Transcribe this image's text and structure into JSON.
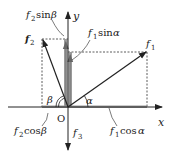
{
  "diagram": {
    "axes": {
      "x_label": "x",
      "y_label": "y",
      "origin_label": "O"
    },
    "vectors": [
      {
        "name": "f1",
        "label_base": "f",
        "label_sub": "1"
      },
      {
        "name": "f2",
        "label_base": "f",
        "label_sub": "2"
      },
      {
        "name": "f3",
        "label_base": "f",
        "label_sub": "3"
      }
    ],
    "angles": {
      "alpha": "α",
      "beta": "β"
    },
    "components": {
      "f2_sin_beta": {
        "base": "f",
        "sub": "2",
        "fn": "sin",
        "angle": "β"
      },
      "f1_sin_alpha": {
        "base": "f",
        "sub": "1",
        "fn": "sin",
        "angle": "α"
      },
      "f2_cos_beta": {
        "base": "f",
        "sub": "2",
        "fn": "cos",
        "angle": "β"
      },
      "f1_cos_alpha": {
        "base": "f",
        "sub": "1",
        "fn": "cos",
        "angle": "α"
      }
    },
    "colors": {
      "ink": "#222222",
      "component_fill": "#9a9a9a"
    }
  }
}
